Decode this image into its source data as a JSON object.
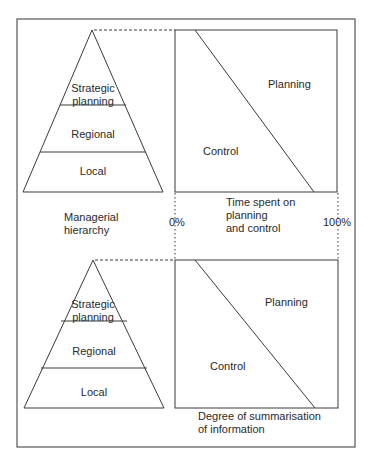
{
  "diagram": {
    "top_panel": {
      "pyramid": {
        "levels": [
          {
            "line1": "Strategic",
            "line2": "planning"
          },
          {
            "label": "Regional"
          },
          {
            "label": "Local"
          }
        ]
      },
      "chart": {
        "upper_region": "Planning",
        "lower_region": "Control"
      }
    },
    "middle": {
      "left_label_line1": "Managerial",
      "left_label_line2": "hierarchy",
      "axis_start": "0%",
      "axis_end": "100%",
      "axis_title_line1": "Time spent on",
      "axis_title_line2": "planning",
      "axis_title_line3": "and control"
    },
    "bottom_panel": {
      "pyramid": {
        "levels": [
          {
            "line1": "Strategic",
            "line2": "planning"
          },
          {
            "label": "Regional"
          },
          {
            "label": "Local"
          }
        ]
      },
      "chart": {
        "upper_region": "Planning",
        "lower_region": "Control"
      },
      "axis_title_line1": "Degree of summarisation",
      "axis_title_line2": "of information"
    },
    "colors": {
      "line": "#3a3a3a",
      "background": "#ffffff"
    }
  }
}
